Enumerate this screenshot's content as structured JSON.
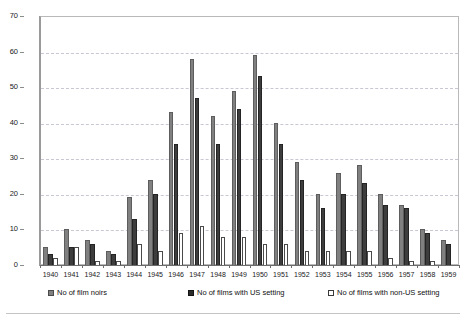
{
  "chart_data": {
    "type": "bar",
    "title": "",
    "subtitle": "",
    "xlabel": "",
    "ylabel": "",
    "ylim": [
      0,
      70
    ],
    "y_ticks": [
      0,
      10,
      20,
      30,
      40,
      50,
      60,
      70
    ],
    "grid": true,
    "legend_position": "bottom",
    "categories": [
      "1940",
      "1941",
      "1942",
      "1943",
      "1944",
      "1945",
      "1946",
      "1947",
      "1948",
      "1949",
      "1950",
      "1951",
      "1952",
      "1953",
      "1954",
      "1955",
      "1956",
      "1957",
      "1958",
      "1959"
    ],
    "series": [
      {
        "name": "No of film noirs",
        "color": "#808080",
        "values": [
          5,
          10,
          7,
          4,
          19,
          24,
          43,
          58,
          42,
          49,
          59,
          40,
          29,
          20,
          26,
          28,
          20,
          17,
          10,
          7
        ]
      },
      {
        "name": "No of films with US setting",
        "color": "#3d3d3d",
        "values": [
          3,
          5,
          6,
          3,
          13,
          20,
          34,
          47,
          34,
          44,
          53,
          34,
          24,
          16,
          20,
          23,
          17,
          16,
          9,
          6
        ]
      },
      {
        "name": "No of films with non-US setting",
        "color": "#ffffff",
        "values": [
          2,
          5,
          1,
          1,
          6,
          4,
          9,
          11,
          8,
          8,
          6,
          6,
          4,
          4,
          4,
          4,
          2,
          1,
          1,
          0
        ]
      }
    ]
  },
  "legend": {
    "items": [
      {
        "label": "No of film noirs",
        "swatch": "gray-square-icon"
      },
      {
        "label": "No of films with US setting",
        "swatch": "dark-square-icon"
      },
      {
        "label": "No of films with non-US setting",
        "swatch": "white-square-icon"
      }
    ]
  },
  "axes": {
    "y_tick_labels": [
      "0",
      "10",
      "20",
      "30",
      "40",
      "50",
      "60",
      "70"
    ],
    "x_tick_labels": [
      "1940",
      "1941",
      "1942",
      "1943",
      "1944",
      "1945",
      "1946",
      "1947",
      "1948",
      "1949",
      "1950",
      "1951",
      "1952",
      "1953",
      "1954",
      "1955",
      "1956",
      "1957",
      "1958",
      "1959"
    ]
  }
}
